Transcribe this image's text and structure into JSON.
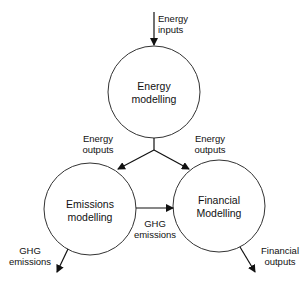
{
  "diagram": {
    "nodes": [
      {
        "id": "energy",
        "line1": "Energy",
        "line2": "modelling"
      },
      {
        "id": "emissions",
        "line1": "Emissions",
        "line2": "modelling"
      },
      {
        "id": "financial",
        "line1": "Financial",
        "line2": "Modelling"
      }
    ],
    "edges": {
      "energy_inputs": {
        "line1": "Energy",
        "line2": "inputs"
      },
      "energy_outputs_left": {
        "line1": "Energy",
        "line2": "outputs"
      },
      "energy_outputs_right": {
        "line1": "Energy",
        "line2": "outputs"
      },
      "ghg_to_financial": {
        "line1": "GHG",
        "line2": "emissions"
      },
      "ghg_out": {
        "line1": "GHG",
        "line2": "emissions"
      },
      "financial_out": {
        "line1": "Financial",
        "line2": "outputs"
      }
    },
    "colors": {
      "stroke": "#222222",
      "background": "#ffffff"
    }
  }
}
